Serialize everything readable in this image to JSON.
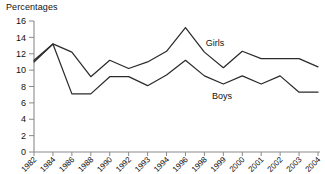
{
  "chart_data": {
    "type": "line",
    "title": "",
    "ylabel": "Percentages",
    "xlabel": "",
    "ylim": [
      0,
      16
    ],
    "yticks": [
      0,
      2,
      4,
      6,
      8,
      10,
      12,
      14,
      16
    ],
    "grid": false,
    "legend_position": "inline-annotation",
    "categories": [
      "1982",
      "1984",
      "1986",
      "1988",
      "1990",
      "1992",
      "1993",
      "1994",
      "1996",
      "1998",
      "1999",
      "2000",
      "2001",
      "2002",
      "2003",
      "2004"
    ],
    "series": [
      {
        "name": "Girls",
        "values": [
          11.2,
          13.2,
          12.2,
          9.2,
          11.2,
          10.2,
          11.0,
          12.3,
          15.2,
          12.2,
          10.3,
          12.3,
          11.4,
          11.4,
          11.4,
          10.4
        ]
      },
      {
        "name": "Boys",
        "values": [
          11.0,
          13.2,
          7.1,
          7.1,
          9.2,
          9.2,
          8.1,
          9.4,
          11.2,
          9.3,
          8.3,
          9.3,
          8.3,
          9.3,
          7.3,
          7.3
        ]
      }
    ],
    "annotations": [
      {
        "text": "Girls",
        "series": "Girls",
        "x_px": 215,
        "y_px": 46
      },
      {
        "text": "Boys",
        "series": "Boys",
        "x_px": 222,
        "y_px": 99
      }
    ],
    "colors": {
      "line": "#2b2b2b",
      "axis": "#8a8a8a",
      "text": "#111111",
      "background": "#ffffff"
    }
  }
}
